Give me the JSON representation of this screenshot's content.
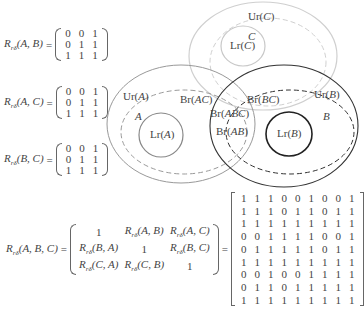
{
  "pairwise_equations": [
    {
      "symbol": "R",
      "subscript": "rδ",
      "args": "(A, B)",
      "matrix": [
        [
          0,
          0,
          1
        ],
        [
          0,
          1,
          1
        ],
        [
          1,
          1,
          1
        ]
      ]
    },
    {
      "symbol": "R",
      "subscript": "rδ",
      "args": "(A, C)",
      "matrix": [
        [
          0,
          0,
          1
        ],
        [
          0,
          1,
          1
        ],
        [
          1,
          1,
          1
        ]
      ]
    },
    {
      "symbol": "R",
      "subscript": "rδ",
      "args": "(B, C)",
      "matrix": [
        [
          0,
          0,
          1
        ],
        [
          0,
          1,
          1
        ],
        [
          1,
          1,
          1
        ]
      ]
    }
  ],
  "composite_equation": {
    "symbol": "R",
    "subscript": "rδ",
    "args": "(A, B, C)",
    "block_matrix": [
      [
        "1",
        "Rrδ(A, B)",
        "Rrδ(A, C)"
      ],
      [
        "Rrδ(B, A)",
        "1",
        "Rrδ(B, C)"
      ],
      [
        "Rrδ(C, A)",
        "Rrδ(C, B)",
        "1"
      ]
    ],
    "result_matrix": [
      [
        1,
        1,
        1,
        0,
        0,
        1,
        0,
        0,
        1
      ],
      [
        1,
        1,
        1,
        0,
        1,
        1,
        0,
        1,
        1
      ],
      [
        1,
        1,
        1,
        1,
        1,
        1,
        1,
        1,
        1
      ],
      [
        0,
        0,
        1,
        1,
        1,
        1,
        0,
        0,
        1
      ],
      [
        0,
        1,
        1,
        1,
        1,
        1,
        0,
        1,
        1
      ],
      [
        1,
        1,
        1,
        1,
        1,
        1,
        1,
        1,
        1
      ],
      [
        0,
        0,
        1,
        0,
        0,
        1,
        1,
        1,
        1
      ],
      [
        0,
        1,
        1,
        0,
        1,
        1,
        1,
        1,
        1
      ],
      [
        1,
        1,
        1,
        1,
        1,
        1,
        1,
        1,
        1
      ]
    ]
  },
  "diagram": {
    "sets": [
      {
        "name": "A",
        "upper": "Ur(A)",
        "lower": "Lr(A)",
        "color": "#8a8a8a"
      },
      {
        "name": "B",
        "upper": "Ur(B)",
        "lower": "Lr(B)",
        "color": "#333333"
      },
      {
        "name": "C",
        "upper": "Ur(C)",
        "lower": "Lr(C)",
        "color": "#c8c8c8"
      }
    ],
    "boundaries": [
      "Br(AC)",
      "Br(BC)",
      "Br(ABC)",
      "Br(AB)"
    ],
    "labels": {
      "ur_c": "Ur(C)",
      "c": "C",
      "lr_c": "Lr(C)",
      "ur_a": "Ur(A)",
      "a": "A",
      "lr_a": "Lr(A)",
      "ur_b": "Ur(B)",
      "b": "B",
      "lr_b": "Lr(B)",
      "br_ac": "Br(AC)",
      "br_bc": "Br(BC)",
      "br_abc": "Br(ABC)",
      "br_ab": "Br(AB)"
    }
  },
  "equals_sign": "="
}
